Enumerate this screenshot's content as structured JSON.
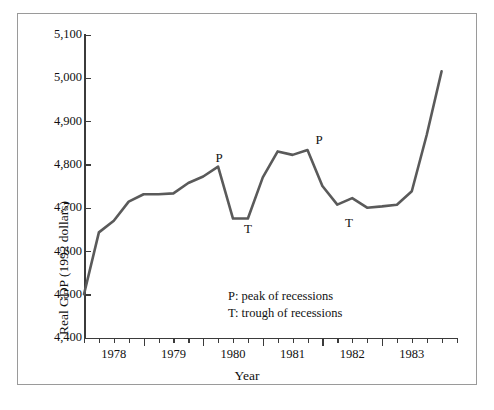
{
  "chart_data": {
    "type": "line",
    "title": "",
    "xlabel": "Year",
    "ylabel": "Real GDP (1992 dollars)",
    "ylim": [
      4400,
      5100
    ],
    "xlim": [
      1977.5,
      1983.75
    ],
    "grid": false,
    "legend_position": "inside-center",
    "y_ticks": [
      "5,100",
      "5,000",
      "4,900",
      "4,800",
      "4,700",
      "4,600",
      "4,500",
      "4,400"
    ],
    "y_tick_values": [
      5100,
      5000,
      4900,
      4800,
      4700,
      4600,
      4500,
      4400
    ],
    "x_ticks": [
      "1978",
      "1979",
      "1980",
      "1981",
      "1982",
      "1983"
    ],
    "x_tick_values": [
      1978,
      1979,
      1980,
      1981,
      1982,
      1983
    ],
    "x_minor_interval": 0.25,
    "series": [
      {
        "name": "Real GDP (1992 dollars)",
        "color": "#5a5a5a",
        "x": [
          1977.5,
          1977.75,
          1978.0,
          1978.25,
          1978.5,
          1978.75,
          1979.0,
          1979.25,
          1979.5,
          1979.75,
          1980.0,
          1980.25,
          1980.5,
          1980.75,
          1981.0,
          1981.25,
          1981.5,
          1981.75,
          1982.0,
          1982.25,
          1982.5,
          1982.75,
          1983.0,
          1983.25,
          1983.5
        ],
        "values": [
          4500,
          4643,
          4670,
          4714,
          4731,
          4731,
          4733,
          4757,
          4772,
          4795,
          4675,
          4675,
          4770,
          4830,
          4822,
          4833,
          4750,
          4707,
          4722,
          4700,
          4703,
          4707,
          4738,
          4868,
          5015
        ]
      }
    ],
    "annotations": [
      {
        "text": "P",
        "x": 1979.75,
        "y": 4795,
        "role": "peak-marker-1"
      },
      {
        "text": "T",
        "x": 1980.13,
        "y": 4675,
        "role": "trough-marker-1"
      },
      {
        "text": "P",
        "x": 1981.25,
        "y": 4833,
        "role": "peak-marker-2"
      },
      {
        "text": "T",
        "x": 1981.75,
        "y": 4707,
        "role": "trough-marker-2"
      }
    ],
    "legend_entries": [
      "P: peak of recessions",
      "T: trough of recessions"
    ]
  },
  "legend": {
    "peak": "P: peak of recessions",
    "trough": "T: trough of recessions"
  },
  "axes": {
    "x_title": "Year",
    "y_title": "Real GDP (1992 dollars)"
  },
  "y_labels": {
    "t0": "5,100",
    "t1": "5,000",
    "t2": "4,900",
    "t3": "4,800",
    "t4": "4,700",
    "t5": "4,600",
    "t6": "4,500",
    "t7": "4,400"
  },
  "x_labels": {
    "t0": "1978",
    "t1": "1979",
    "t2": "1980",
    "t3": "1981",
    "t4": "1982",
    "t5": "1983"
  },
  "markers": {
    "p1": "P",
    "t1": "T",
    "p2": "P",
    "t2": "T"
  },
  "colors": {
    "line": "#5a5a5a",
    "axis": "#3b3b3b",
    "frame": "#9a9a9a",
    "text": "#111111",
    "background": "#ffffff"
  }
}
